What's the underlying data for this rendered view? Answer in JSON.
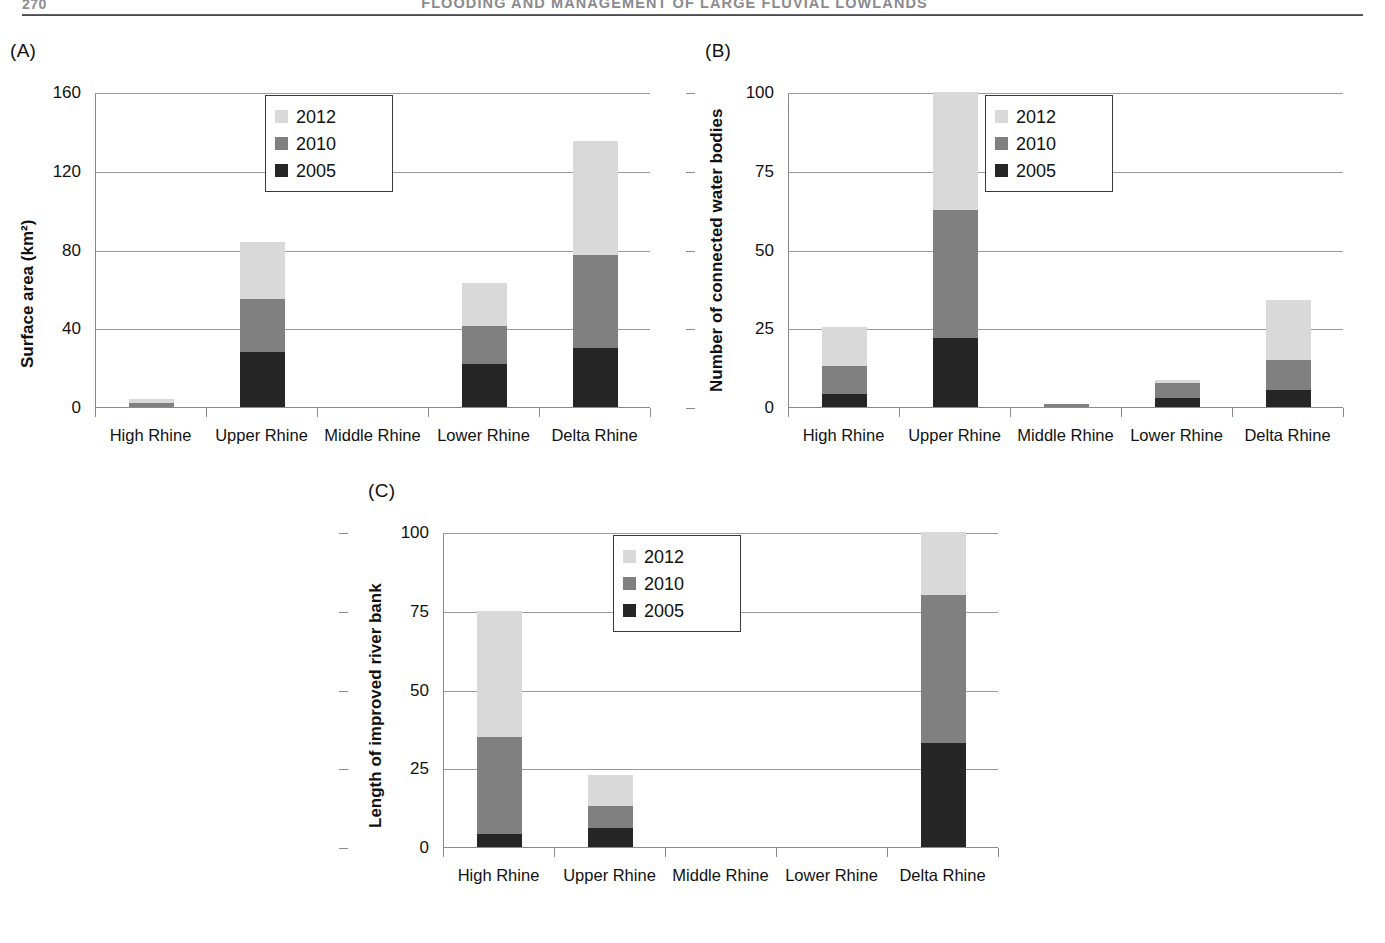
{
  "page": {
    "folio": "270",
    "running_head": "FLOODING AND MANAGEMENT OF LARGE FLUVIAL LOWLANDS"
  },
  "legend": {
    "entries": [
      {
        "label": "2012",
        "color": "#d9d9d9"
      },
      {
        "label": "2010",
        "color": "#808080"
      },
      {
        "label": "2005",
        "color": "#262626"
      }
    ]
  },
  "palette": {
    "series_2012": "#d9d9d9",
    "series_2010": "#808080",
    "series_2005": "#262626",
    "axis": "#8a8a8a",
    "gridline": "#9a9a9a"
  },
  "chart_data": [
    {
      "id": "A",
      "panel_label": "(A)",
      "type": "bar",
      "stacked": true,
      "title": "",
      "xlabel": "",
      "ylabel": "Surface area (km²)",
      "ylim": [
        0,
        160
      ],
      "yticks": [
        0,
        40,
        80,
        120,
        160
      ],
      "grid": true,
      "legend_position": "upper-center",
      "categories": [
        "High Rhine",
        "Upper Rhine",
        "Middle Rhine",
        "Lower Rhine",
        "Delta Rhine"
      ],
      "series": [
        {
          "name": "2005",
          "values": [
            0,
            28,
            0,
            22,
            30
          ]
        },
        {
          "name": "2010",
          "values": [
            2,
            27,
            0,
            19,
            47
          ]
        },
        {
          "name": "2012",
          "values": [
            2,
            29,
            0,
            22,
            58
          ]
        }
      ],
      "totals": [
        4,
        84,
        0,
        63,
        135
      ]
    },
    {
      "id": "B",
      "panel_label": "(B)",
      "type": "bar",
      "stacked": true,
      "title": "",
      "xlabel": "",
      "ylabel": "Number of connected water bodies",
      "ylim": [
        0,
        100
      ],
      "yticks": [
        0,
        25,
        50,
        75,
        100
      ],
      "grid": true,
      "legend_position": "upper-center",
      "categories": [
        "High Rhine",
        "Upper Rhine",
        "Middle Rhine",
        "Lower Rhine",
        "Delta Rhine"
      ],
      "series": [
        {
          "name": "2005",
          "values": [
            4,
            22,
            0,
            3,
            5.5
          ]
        },
        {
          "name": "2010",
          "values": [
            9,
            40.5,
            1,
            4.5,
            9.5
          ]
        },
        {
          "name": "2012",
          "values": [
            12.5,
            37.5,
            0,
            1,
            19
          ]
        }
      ],
      "totals": [
        25.5,
        100,
        1,
        8.5,
        34
      ]
    },
    {
      "id": "C",
      "panel_label": "(C)",
      "type": "bar",
      "stacked": true,
      "title": "",
      "xlabel": "",
      "ylabel": "Length of improved river bank",
      "ylim": [
        0,
        100
      ],
      "yticks": [
        0,
        25,
        50,
        75,
        100
      ],
      "grid": true,
      "legend_position": "upper-center",
      "categories": [
        "High Rhine",
        "Upper Rhine",
        "Middle Rhine",
        "Lower Rhine",
        "Delta Rhine"
      ],
      "series": [
        {
          "name": "2005",
          "values": [
            4,
            6,
            0,
            0,
            33
          ]
        },
        {
          "name": "2010",
          "values": [
            31,
            7,
            0,
            0,
            47
          ]
        },
        {
          "name": "2012",
          "values": [
            40,
            10,
            0,
            0,
            20
          ]
        }
      ],
      "totals": [
        75,
        23,
        0,
        0,
        100
      ]
    }
  ]
}
